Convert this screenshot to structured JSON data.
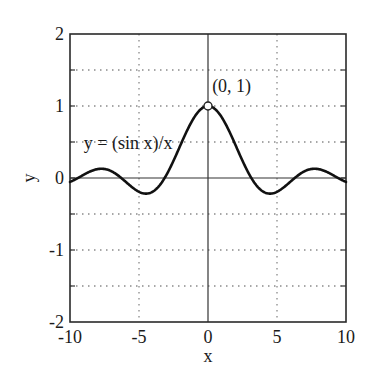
{
  "chart_data": {
    "type": "line",
    "title": "",
    "xlabel": "x",
    "ylabel": "y",
    "xlim": [
      -10,
      10
    ],
    "ylim": [
      -2,
      2
    ],
    "xticks": [
      -10,
      -5,
      0,
      5,
      10
    ],
    "yticks": [
      -2,
      -1,
      0,
      1,
      2
    ],
    "x_tick_labels": [
      "-10",
      "-5",
      "0",
      "5",
      "10"
    ],
    "y_tick_labels": [
      "-2",
      "-1",
      "0",
      "1",
      "2"
    ],
    "grid": {
      "on": true,
      "style": "dotted",
      "x_lines": [
        -5,
        5
      ],
      "y_lines": [
        -1.5,
        -1,
        -0.5,
        0.5,
        1,
        1.5
      ]
    },
    "axes_lines": {
      "x0": true,
      "y0": true
    },
    "legend": null,
    "series": [
      {
        "name": "y = (sin x)/x",
        "function": "sin(x)/x",
        "color": "#111111",
        "x": [
          -10,
          -9,
          -8,
          -7.725,
          -7,
          -6,
          -5,
          -4.493,
          -4,
          -3,
          -2,
          -1,
          0,
          1,
          2,
          3,
          4,
          4.493,
          5,
          6,
          7,
          7.725,
          8,
          9,
          10
        ],
        "y": [
          -0.054,
          0.046,
          0.124,
          0.128,
          0.094,
          -0.047,
          -0.192,
          -0.217,
          -0.189,
          0.047,
          0.455,
          0.841,
          1.0,
          0.841,
          0.455,
          0.047,
          -0.189,
          -0.217,
          -0.192,
          -0.047,
          0.094,
          0.128,
          0.124,
          0.046,
          -0.054
        ]
      }
    ],
    "annotations": [
      {
        "text": "y = (sin x)/x",
        "x": -9.0,
        "y": 0.45
      },
      {
        "text": "(0, 1)",
        "x": 0.3,
        "y": 1.2,
        "marker": {
          "x": 0,
          "y": 1,
          "style": "open-circle"
        }
      }
    ]
  }
}
